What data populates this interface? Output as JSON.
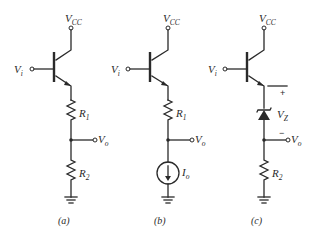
{
  "figure": {
    "circuits": [
      {
        "id": "a",
        "caption": "(a)",
        "supply": {
          "main": "V",
          "sub": "CC"
        },
        "input": {
          "main": "V",
          "sub": "i"
        },
        "output": {
          "main": "V",
          "sub": "o"
        },
        "upper_element": {
          "type": "resistor",
          "main": "R",
          "sub": "1"
        },
        "lower_element": {
          "type": "resistor",
          "main": "R",
          "sub": "2"
        }
      },
      {
        "id": "b",
        "caption": "(b)",
        "supply": {
          "main": "V",
          "sub": "CC"
        },
        "input": {
          "main": "V",
          "sub": "i"
        },
        "output": {
          "main": "V",
          "sub": "o"
        },
        "upper_element": {
          "type": "resistor",
          "main": "R",
          "sub": "1"
        },
        "lower_element": {
          "type": "current-source",
          "main": "I",
          "sub": "o"
        }
      },
      {
        "id": "c",
        "caption": "(c)",
        "supply": {
          "main": "V",
          "sub": "CC"
        },
        "input": {
          "main": "V",
          "sub": "i"
        },
        "output": {
          "main": "V",
          "sub": "o"
        },
        "upper_element": {
          "type": "zener-diode",
          "main": "V",
          "sub": "Z",
          "plus": "+",
          "minus": "−"
        },
        "lower_element": {
          "type": "resistor",
          "main": "R",
          "sub": "2"
        }
      }
    ],
    "colors": {
      "ink": "#2a2a2a",
      "background": "#ffffff"
    }
  }
}
